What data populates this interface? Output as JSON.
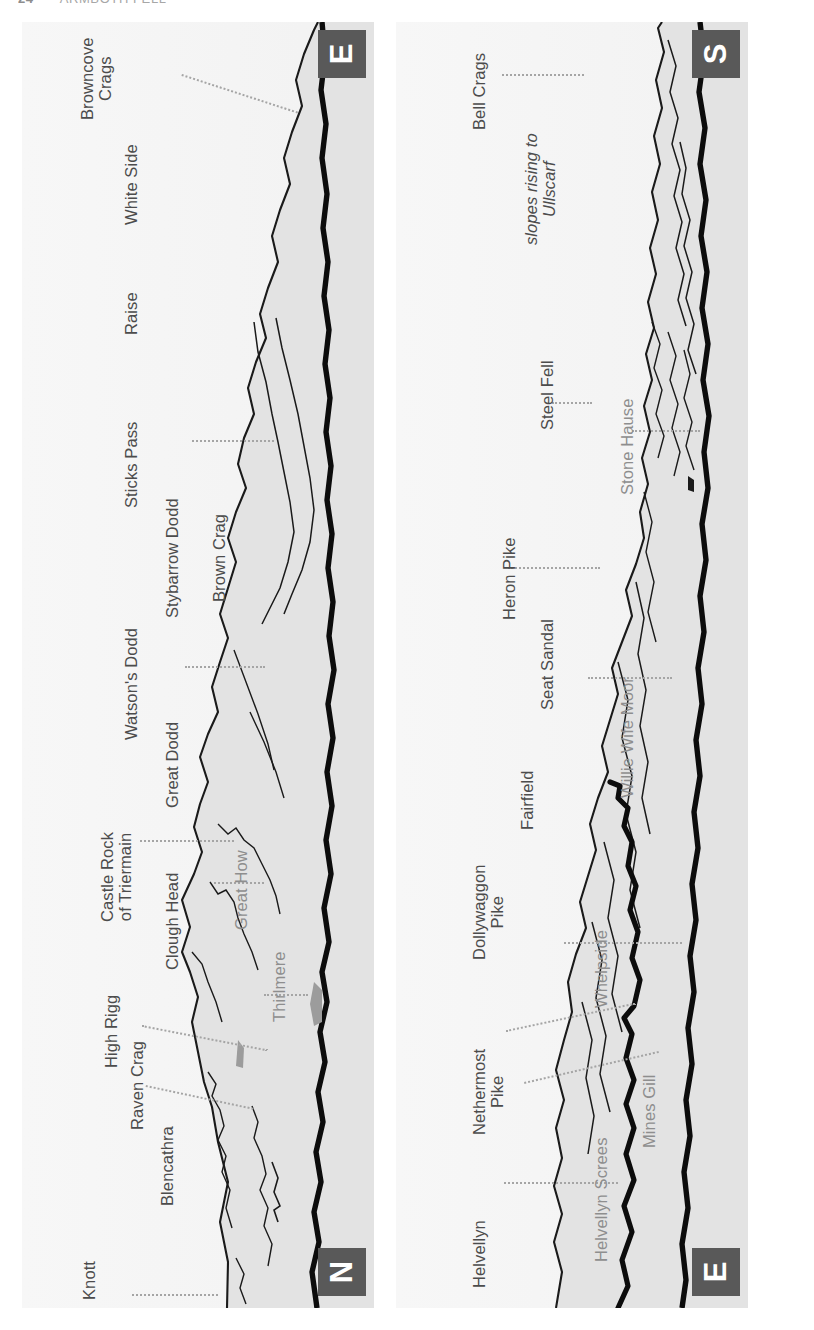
{
  "running_head": {
    "folio": "24",
    "title": "ARMBOTH FELL"
  },
  "side_title": "PANORAMA",
  "colors": {
    "ink": "#4c4c4c",
    "grey_ink": "#8e8e8e",
    "compass_box": "#595959",
    "compass_text": "#ffffff",
    "panel_sky": "#f4f4f4",
    "panel_hill": "#e2e2e2",
    "leader": "#a5a5a5",
    "ridge_line": "#111111"
  },
  "panels": [
    {
      "id": "upper",
      "compass_start": "E",
      "compass_end": "N",
      "labels": [
        {
          "text": "Browncove\nCrags",
          "style": "dark",
          "lines": 2
        },
        {
          "text": "White Side",
          "style": "dark",
          "lines": 1
        },
        {
          "text": "Raise",
          "style": "dark",
          "lines": 1
        },
        {
          "text": "Sticks Pass",
          "style": "dark",
          "lines": 1
        },
        {
          "text": "Stybarrow Dodd",
          "style": "dark",
          "lines": 1
        },
        {
          "text": "Brown Crag",
          "style": "dark",
          "lines": 1
        },
        {
          "text": "Watson's Dodd",
          "style": "dark",
          "lines": 1
        },
        {
          "text": "Great Dodd",
          "style": "dark",
          "lines": 1
        },
        {
          "text": "Castle Rock\nof Triermain",
          "style": "dark",
          "lines": 2
        },
        {
          "text": "Clough Head",
          "style": "dark",
          "lines": 1
        },
        {
          "text": "Great How",
          "style": "grey",
          "lines": 1
        },
        {
          "text": "Thirlmere",
          "style": "grey",
          "lines": 1
        },
        {
          "text": "High Rigg",
          "style": "dark",
          "lines": 1
        },
        {
          "text": "Raven Crag",
          "style": "dark",
          "lines": 1
        },
        {
          "text": "Blencathra",
          "style": "dark",
          "lines": 1
        },
        {
          "text": "Knott",
          "style": "dark",
          "lines": 1
        }
      ]
    },
    {
      "id": "lower",
      "compass_start": "S",
      "compass_end": "E",
      "labels": [
        {
          "text": "Bell Crags",
          "style": "dark",
          "lines": 1
        },
        {
          "text": "slopes rising to\nUllscarf",
          "style": "italic",
          "lines": 2
        },
        {
          "text": "Steel Fell",
          "style": "dark",
          "lines": 1
        },
        {
          "text": "Stone Hause",
          "style": "grey",
          "lines": 1
        },
        {
          "text": "Heron Pike",
          "style": "dark",
          "lines": 1
        },
        {
          "text": "Seat Sandal",
          "style": "dark",
          "lines": 1
        },
        {
          "text": "Willie Wife Moor",
          "style": "grey",
          "lines": 1
        },
        {
          "text": "Fairfield",
          "style": "dark",
          "lines": 1
        },
        {
          "text": "Dollywaggon\nPike",
          "style": "dark",
          "lines": 2
        },
        {
          "text": "Whelpside",
          "style": "grey",
          "lines": 1
        },
        {
          "text": "Nethermost\nPike",
          "style": "dark",
          "lines": 2
        },
        {
          "text": "Mines Gill",
          "style": "grey",
          "lines": 1
        },
        {
          "text": "Helvellyn Screes",
          "style": "grey",
          "lines": 1
        },
        {
          "text": "Helvellyn",
          "style": "dark",
          "lines": 1
        }
      ]
    }
  ]
}
